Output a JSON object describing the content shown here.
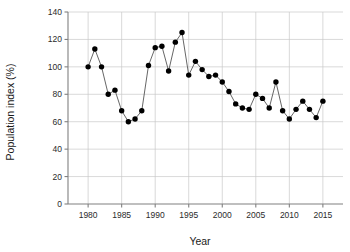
{
  "chart_data": {
    "type": "line",
    "title": "",
    "subtitle": "",
    "xlabel": "Year",
    "ylabel": "Population index (%)",
    "xlim": [
      1977,
      2018
    ],
    "ylim": [
      0,
      140
    ],
    "grid": true,
    "legend": null,
    "marker": "filled-circle",
    "marker_color": "#000000",
    "line_color": "#555555",
    "grid_color": "#c8c8c8",
    "axis_color": "#808080",
    "xticks": [
      1980,
      1985,
      1990,
      1995,
      2000,
      2005,
      2010,
      2015
    ],
    "xtick_labels": [
      "1980",
      "1985",
      "1990",
      "1995",
      "2000",
      "2005",
      "2010",
      "2015"
    ],
    "yticks": [
      0,
      20,
      40,
      60,
      80,
      100,
      120,
      140
    ],
    "ytick_labels": [
      "0",
      "20",
      "40",
      "60",
      "80",
      "100",
      "120",
      "140"
    ],
    "x": [
      1980,
      1981,
      1982,
      1983,
      1984,
      1985,
      1986,
      1987,
      1988,
      1989,
      1990,
      1991,
      1992,
      1993,
      1994,
      1995,
      1996,
      1997,
      1998,
      1999,
      2000,
      2001,
      2002,
      2003,
      2004,
      2005,
      2006,
      2007,
      2008,
      2009,
      2010,
      2011,
      2012,
      2013,
      2014,
      2015
    ],
    "values": [
      100,
      113,
      100,
      80,
      83,
      68,
      60,
      62,
      68,
      101,
      114,
      115,
      97,
      118,
      125,
      94,
      104,
      98,
      93,
      94,
      89,
      82,
      73,
      70,
      69,
      80,
      77,
      70,
      89,
      68,
      62,
      69,
      75,
      69,
      63,
      75
    ],
    "series": [
      {
        "name": "Population index",
        "values": [
          100,
          113,
          100,
          80,
          83,
          68,
          60,
          62,
          68,
          101,
          114,
          115,
          97,
          118,
          125,
          94,
          104,
          98,
          93,
          94,
          89,
          82,
          73,
          70,
          69,
          80,
          77,
          70,
          89,
          68,
          62,
          69,
          75,
          69,
          63,
          75
        ]
      }
    ]
  }
}
